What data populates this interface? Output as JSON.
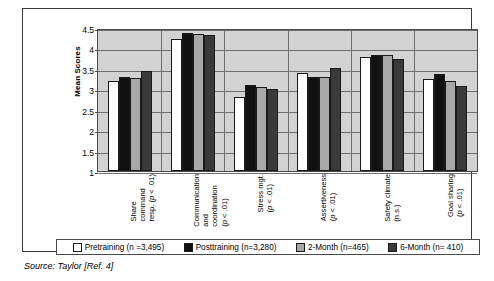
{
  "chart_data": {
    "type": "bar",
    "title": "",
    "xlabel": "",
    "ylabel": "Mean Scores",
    "ylim": [
      1,
      4.5
    ],
    "yticks": [
      "1",
      "1.5",
      "2",
      "2.5",
      "3",
      "3.5",
      "4",
      "4.5"
    ],
    "grid": true,
    "legend_position": "bottom",
    "categories": [
      {
        "lines": [
          "Share",
          "command",
          "resp. (p < .01)"
        ],
        "full": "Share command resp. (p < .01)"
      },
      {
        "lines": [
          "Communication",
          "and",
          "coordination",
          "(p < .01)"
        ],
        "full": "Communication and coordination (p < .01)"
      },
      {
        "lines": [
          "Stress mgt.",
          "(p < .01)"
        ],
        "full": "Stress mgt. (p < .01)"
      },
      {
        "lines": [
          "Assertiveness",
          "(p < .01)"
        ],
        "full": "Assertiveness (p < .01)"
      },
      {
        "lines": [
          "Safety climate",
          "(n.s.)"
        ],
        "full": "Safety climate (n.s.)"
      },
      {
        "lines": [
          "Goal sharing",
          "(p < .01)"
        ],
        "full": "Goal sharing (p < .01)"
      }
    ],
    "series": [
      {
        "name": "Pretraining (n =3,495)",
        "color": "#ffffff",
        "values": [
          3.2,
          4.23,
          2.8,
          3.39,
          3.78,
          3.25
        ]
      },
      {
        "name": "Posttraining (n=3,280)",
        "color": "#111111",
        "values": [
          3.31,
          4.38,
          3.1,
          3.29,
          3.84,
          3.38
        ]
      },
      {
        "name": "2-Month (n=465)",
        "color": "#a8a8a8",
        "values": [
          3.28,
          4.36,
          3.05,
          3.29,
          3.83,
          3.21
        ]
      },
      {
        "name": "6-Month (n= 410)",
        "color": "#3a3a3a",
        "values": [
          3.45,
          4.33,
          3.01,
          3.51,
          3.74,
          3.08
        ]
      }
    ]
  },
  "legend": {
    "items": [
      {
        "label": "Pretraining (n =3,495)"
      },
      {
        "label": "Posttraining (n=3,280)"
      },
      {
        "label": "2-Month (n=465)"
      },
      {
        "label": "6-Month (n= 410)"
      }
    ]
  },
  "source": {
    "text": "Source: Taylor [Ref. 4]"
  }
}
